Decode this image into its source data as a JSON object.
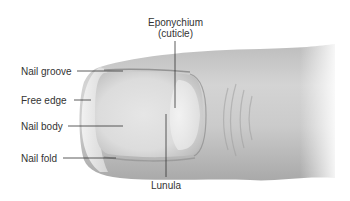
{
  "diagram": {
    "labels": {
      "eponychium_line1": "Eponychium",
      "eponychium_line2": "(cuticle)",
      "nail_groove": "Nail groove",
      "free_edge": "Free edge",
      "nail_body": "Nail body",
      "nail_fold": "Nail fold",
      "lunula": "Lunula"
    },
    "colors": {
      "label_text": "#333333",
      "leader_line": "#333333",
      "skin_light": "#f2f2f2",
      "skin_mid": "#cfcfcf",
      "skin_dark": "#a8a8a8",
      "nail_fill": "#e8e8e8"
    }
  }
}
